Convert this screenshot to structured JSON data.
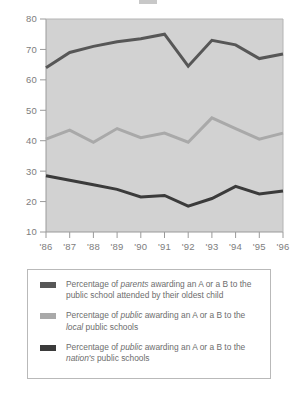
{
  "chart_data": {
    "type": "line",
    "title": "",
    "xlabel": "",
    "ylabel": "",
    "categories": [
      "'86",
      "'87",
      "'88",
      "'89",
      "'90",
      "'91",
      "'92",
      "'93",
      "'94",
      "'95",
      "'96"
    ],
    "ylim": [
      10,
      80
    ],
    "yticks": [
      10,
      20,
      30,
      40,
      50,
      60,
      70,
      80
    ],
    "ytick_labels": [
      "10",
      "20",
      "30",
      "40",
      "50",
      "60",
      "70",
      "80"
    ],
    "grid": false,
    "legend_position": "below",
    "plot_background": "#d2d2d2",
    "series": [
      {
        "name": "Percentage of parents awarding an A or a B to the public school attended by their oldest child",
        "color": "#575757",
        "values": [
          64,
          69,
          71,
          72.5,
          73.5,
          75,
          64.5,
          73,
          71.5,
          67,
          68.5
        ]
      },
      {
        "name": "Percentage of public awarding an A or a B to the local public schools",
        "color": "#a9a9a9",
        "values": [
          40.5,
          43.5,
          39.5,
          44,
          41,
          42.5,
          39.5,
          47.5,
          44,
          40.5,
          42.5
        ]
      },
      {
        "name": "Percentage of public awarding an A or a B to the nation's public schools",
        "color": "#3b3b3b",
        "values": [
          28.5,
          27,
          25.5,
          24,
          21.5,
          22,
          18.5,
          21,
          25,
          22.5,
          23.5
        ]
      }
    ]
  },
  "legend": {
    "items": [
      {
        "swatch_color": "#575757",
        "text_html": "Percentage of <em>parents</em> awarding an A or a B to the public school attended by their oldest child"
      },
      {
        "swatch_color": "#a9a9a9",
        "text_html": "Percentage of <em>public</em> awarding an A or a B to the <em>local</em> public schools"
      },
      {
        "swatch_color": "#3b3b3b",
        "text_html": "Percentage of <em>public</em> awarding an A or a B to the <em>nation's</em> public schools"
      }
    ]
  }
}
